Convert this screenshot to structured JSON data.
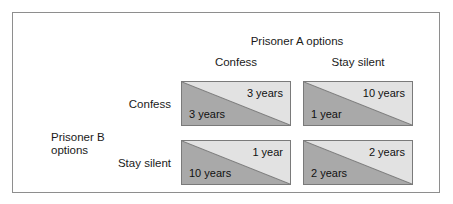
{
  "diagram": {
    "column_group_label": "Prisoner A options",
    "row_group_label_line1": "Prisoner B",
    "row_group_label_line2": "options",
    "column_headers": [
      "Confess",
      "Stay silent"
    ],
    "row_headers": [
      "Confess",
      "Stay silent"
    ],
    "colors": {
      "triangle_dark": "#a9a9a9",
      "triangle_light": "#e2e2e2",
      "cell_border": "#7a7a7a",
      "frame_border": "#8e8e8e",
      "text": "#111111",
      "background": "#ffffff"
    },
    "cells": [
      {
        "row": "Confess",
        "column": "Confess",
        "upper_value": "3 years",
        "lower_value": "3 years"
      },
      {
        "row": "Confess",
        "column": "Stay silent",
        "upper_value": "10 years",
        "lower_value": "1 year"
      },
      {
        "row": "Stay silent",
        "column": "Confess",
        "upper_value": "1 year",
        "lower_value": "10 years"
      },
      {
        "row": "Stay silent",
        "column": "Stay silent",
        "upper_value": "2 years",
        "lower_value": "2 years"
      }
    ]
  }
}
